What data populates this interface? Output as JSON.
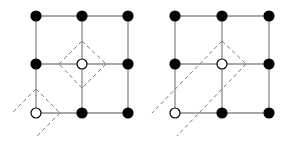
{
  "diagram": {
    "panels": [
      {
        "id": "left",
        "grid": {
          "xs": [
            36,
            82,
            128
          ],
          "ys": [
            16,
            64,
            113
          ],
          "edge_color": "#8a8a8a"
        },
        "nodes": [
          {
            "x": 36,
            "y": 16,
            "fill": "filled"
          },
          {
            "x": 82,
            "y": 16,
            "fill": "filled"
          },
          {
            "x": 128,
            "y": 16,
            "fill": "filled"
          },
          {
            "x": 36,
            "y": 64,
            "fill": "filled"
          },
          {
            "x": 82,
            "y": 64,
            "fill": "open"
          },
          {
            "x": 128,
            "y": 64,
            "fill": "filled"
          },
          {
            "x": 36,
            "y": 113,
            "fill": "open"
          },
          {
            "x": 82,
            "y": 113,
            "fill": "filled"
          },
          {
            "x": 128,
            "y": 113,
            "fill": "filled"
          }
        ],
        "dashed": [
          {
            "x1": 82,
            "y1": 41,
            "x2": 106,
            "y2": 64
          },
          {
            "x1": 106,
            "y1": 64,
            "x2": 82,
            "y2": 88
          },
          {
            "x1": 82,
            "y1": 88,
            "x2": 59,
            "y2": 64
          },
          {
            "x1": 59,
            "y1": 64,
            "x2": 82,
            "y2": 41
          },
          {
            "x1": 36,
            "y1": 89,
            "x2": 12,
            "y2": 113
          },
          {
            "x1": 36,
            "y1": 89,
            "x2": 60,
            "y2": 113
          },
          {
            "x1": 60,
            "y1": 113,
            "x2": 36,
            "y2": 137
          }
        ]
      },
      {
        "id": "right",
        "grid": {
          "xs": [
            175,
            222,
            269
          ],
          "ys": [
            16,
            64,
            113
          ],
          "edge_color": "#8a8a8a"
        },
        "nodes": [
          {
            "x": 175,
            "y": 16,
            "fill": "filled"
          },
          {
            "x": 222,
            "y": 16,
            "fill": "filled"
          },
          {
            "x": 269,
            "y": 16,
            "fill": "filled"
          },
          {
            "x": 175,
            "y": 64,
            "fill": "filled"
          },
          {
            "x": 222,
            "y": 64,
            "fill": "open"
          },
          {
            "x": 269,
            "y": 64,
            "fill": "filled"
          },
          {
            "x": 175,
            "y": 113,
            "fill": "open"
          },
          {
            "x": 222,
            "y": 113,
            "fill": "filled"
          },
          {
            "x": 269,
            "y": 113,
            "fill": "filled"
          }
        ],
        "dashed": [
          {
            "x1": 222,
            "y1": 41,
            "x2": 152,
            "y2": 113
          },
          {
            "x1": 222,
            "y1": 41,
            "x2": 246,
            "y2": 64
          },
          {
            "x1": 246,
            "y1": 64,
            "x2": 177,
            "y2": 136
          }
        ]
      }
    ],
    "style": {
      "node_radius": 5,
      "filled_color": "#000000",
      "open_fill": "#ffffff",
      "open_stroke": "#000000",
      "dash_color": "#7a7a7a"
    }
  }
}
